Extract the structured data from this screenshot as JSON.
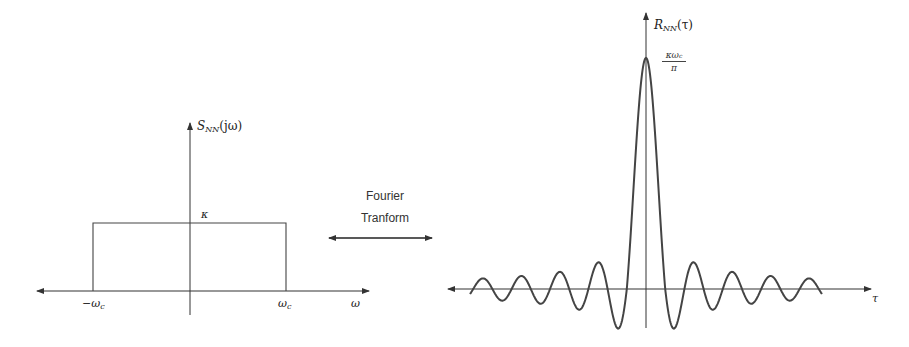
{
  "left_plot": {
    "y_label_main": "S",
    "y_label_sub": "NN",
    "y_label_arg": "(jω)",
    "level_label": "κ",
    "x_tick_left": "−ω",
    "x_tick_left_sub": "c",
    "x_tick_right": "ω",
    "x_tick_right_sub": "c",
    "x_label": "ω"
  },
  "transform": {
    "line1": "Fourier",
    "line2": "Tranform",
    "arrow": "double-arrow"
  },
  "right_plot": {
    "y_label_main": "R",
    "y_label_sub": "NN",
    "y_label_arg": "(τ)",
    "peak_numerator": "κω",
    "peak_numerator_sub": "c",
    "peak_denominator": "π",
    "x_label": "τ"
  },
  "chart_data": [
    {
      "type": "line",
      "title": "Power spectral density (ideal low-pass)",
      "xlabel": "ω",
      "ylabel": "S_NN(jω)",
      "x": [
        "-ω_c",
        "-ω_c",
        "ω_c",
        "ω_c"
      ],
      "values": [
        0,
        1,
        1,
        0
      ],
      "level_label": "κ",
      "tick_labels": [
        "-ω_c",
        "ω_c"
      ],
      "grid": false
    },
    {
      "type": "line",
      "title": "Autocorrelation (sinc)",
      "xlabel": "τ",
      "ylabel": "R_NN(τ)",
      "function": "(κω_c/π)·sinc(ω_c τ)",
      "peak_label": "κω_c/π",
      "peak_value_normalized": 1.0,
      "side_lobes_each_side": 8,
      "grid": false
    }
  ],
  "colors": {
    "axis": "#333333",
    "curve": "#444444",
    "text": "#222222"
  }
}
